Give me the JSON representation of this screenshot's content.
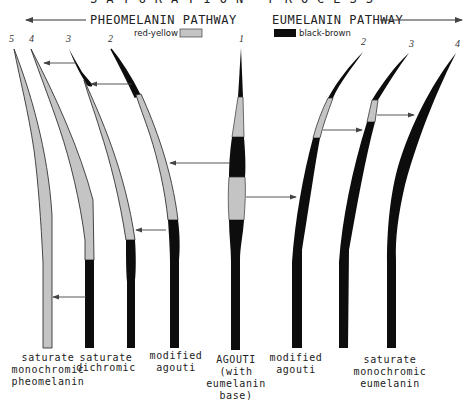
{
  "title": "SATURATION PROCESS",
  "pathways": {
    "left": {
      "label": "PHEOMELANIN PATHWAY",
      "direction": "left"
    },
    "right": {
      "label": "EUMELANIN PATHWAY",
      "direction": "right"
    }
  },
  "legend": [
    {
      "label": "red-yellow",
      "color": "#c4c4c4"
    },
    {
      "label": "black-brown",
      "color": "#0d0d0d"
    }
  ],
  "colors": {
    "pheomelanin": "#c4c4c4",
    "eumelanin": "#0d0d0d",
    "outline": "#333333",
    "arrow": "#444444"
  },
  "hairs": [
    {
      "id": "p5",
      "number": "5",
      "pathway": "pheomelanin",
      "pattern": "all red-yellow"
    },
    {
      "id": "p4",
      "number": "4",
      "pathway": "pheomelanin",
      "pattern": "red-yellow with black base"
    },
    {
      "id": "p3",
      "number": "3",
      "pathway": "pheomelanin",
      "pattern": "black tip, red-yellow, black base"
    },
    {
      "id": "p2",
      "number": "2",
      "pathway": "pheomelanin",
      "pattern": "black tip, red-yellow, black base"
    },
    {
      "id": "a1",
      "number": "1",
      "pathway": "agouti",
      "pattern": "black, yellow, black, yellow, black"
    },
    {
      "id": "e2",
      "number": "2",
      "pathway": "eumelanin",
      "pattern": "black, yellow band, black"
    },
    {
      "id": "e3",
      "number": "3",
      "pathway": "eumelanin",
      "pattern": "black, narrow yellow band, black"
    },
    {
      "id": "e4",
      "number": "4",
      "pathway": "eumelanin",
      "pattern": "all black"
    }
  ],
  "labels": {
    "p5": [
      "saturate",
      "monochromic",
      "pheomelanin"
    ],
    "p3": [
      "saturate",
      "dichromic"
    ],
    "p2": [
      "modified",
      "agouti"
    ],
    "a1": [
      "AGOUTI",
      "(with",
      "eumelanin",
      "base)"
    ],
    "e2": [
      "modified",
      "agouti"
    ],
    "e4": [
      "saturate",
      "monochromic",
      "eumelanin"
    ]
  }
}
